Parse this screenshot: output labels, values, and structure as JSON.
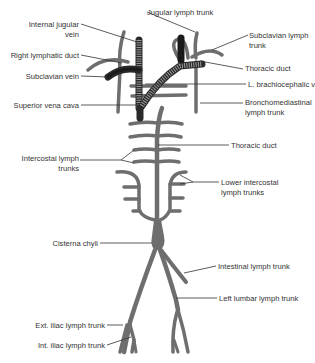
{
  "figure": {
    "colors": {
      "lymph_vessel": "#6e6e6e",
      "vein": "#2a2a2a",
      "label_text": "#333333",
      "background": "#ffffff"
    },
    "labels": {
      "internal_jugular_vein": [
        "Internal jugular",
        "vein"
      ],
      "jugular_lymph_trunk": "Jugular lymph trunk",
      "subclavian_lymph_trunk": [
        "Subclavian lymph",
        "trunk"
      ],
      "right_lymphatic_duct": "Right lymphatic duct",
      "thoracic_duct_upper": "Thoracic duct",
      "subclavian_vein": "Subclavian vein",
      "l_brachiocephalic_v": "L. brachiocephalic v.",
      "superior_vena_cava": "Superior vena cava",
      "bronchomediastinal_lymph_trunk": [
        "Bronchomediastinal",
        "lymph trunk"
      ],
      "thoracic_duct": "Thoracic duct",
      "intercostal_lymph_trunks": [
        "Intercostal lymph",
        "trunks"
      ],
      "lower_intercostal_lymph_trunks": [
        "Lower intercostal",
        "lymph trunks"
      ],
      "cisterna_chyli": "Cisterna chyli",
      "intestinal_lymph_trunk": "Intestinal lymph trunk",
      "left_lumbar_lymph_trunk": "Left lumbar lymph trunk",
      "ext_iliac_lymph_trunk": "Ext. iliac lymph trunk",
      "int_iliac_lymph_trunk": "Int. iliac lymph trunk"
    }
  }
}
